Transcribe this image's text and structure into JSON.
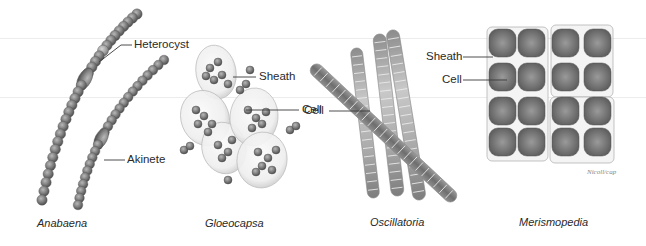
{
  "figure": {
    "panels": [
      {
        "id": "anabaena",
        "caption": "Anabaena",
        "labels": [
          "Heterocyst",
          "Akinete"
        ]
      },
      {
        "id": "gloeocapsa",
        "caption": "Gloeocapsa",
        "labels": [
          "Sheath",
          "Cell"
        ]
      },
      {
        "id": "oscillatoria",
        "caption": "Oscillatoria",
        "labels": [
          "Cell"
        ]
      },
      {
        "id": "merismopedia",
        "caption": "Merismopedia",
        "labels": [
          "Sheath",
          "Cell"
        ]
      }
    ],
    "signature": "Nicoll/cap",
    "colors": {
      "background": "#ffffff",
      "text": "#2a2a2a",
      "leader_line": "#3a3a3a",
      "cell_dark": "#5e5e5e",
      "cell_mid": "#8a8a8a",
      "cell_light": "#b8b8b8",
      "sheath": "#d8d8d8"
    }
  }
}
